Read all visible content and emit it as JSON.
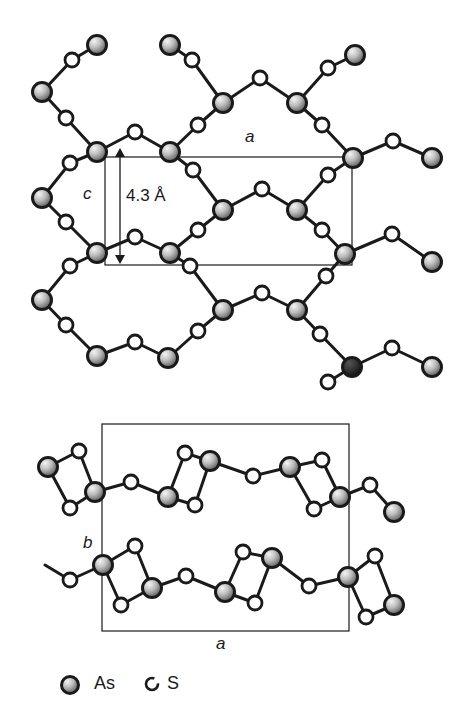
{
  "figure": {
    "top_view": {
      "axis_a_label": "a",
      "axis_c_label": "c",
      "spacing_label": "4.3 Å",
      "unit_cell": {
        "x1": 105,
        "y1": 157,
        "x2": 352,
        "y2": 265
      },
      "arrow": {
        "x": 120,
        "y1": 148,
        "y2": 264
      },
      "bonds": [
        [
          97,
          45,
          72,
          60
        ],
        [
          72,
          60,
          42,
          92
        ],
        [
          42,
          92,
          66,
          118
        ],
        [
          66,
          118,
          97,
          152
        ],
        [
          97,
          152,
          135,
          132
        ],
        [
          135,
          132,
          170,
          152
        ],
        [
          170,
          45,
          192,
          60
        ],
        [
          192,
          60,
          223,
          103
        ],
        [
          223,
          103,
          260,
          78
        ],
        [
          260,
          78,
          297,
          103
        ],
        [
          297,
          103,
          328,
          68
        ],
        [
          328,
          68,
          355,
          55
        ],
        [
          223,
          103,
          198,
          125
        ],
        [
          198,
          125,
          170,
          152
        ],
        [
          297,
          103,
          322,
          125
        ],
        [
          322,
          125,
          353,
          158
        ],
        [
          353,
          158,
          393,
          141
        ],
        [
          393,
          141,
          432,
          158
        ],
        [
          97,
          152,
          70,
          163
        ],
        [
          70,
          163,
          42,
          198
        ],
        [
          42,
          198,
          66,
          222
        ],
        [
          66,
          222,
          97,
          253
        ],
        [
          170,
          152,
          193,
          170
        ],
        [
          193,
          170,
          223,
          210
        ],
        [
          223,
          210,
          262,
          189
        ],
        [
          262,
          189,
          297,
          210
        ],
        [
          297,
          210,
          328,
          175
        ],
        [
          328,
          175,
          353,
          158
        ],
        [
          97,
          253,
          135,
          237
        ],
        [
          135,
          237,
          170,
          253
        ],
        [
          170,
          253,
          198,
          230
        ],
        [
          198,
          230,
          223,
          210
        ],
        [
          297,
          210,
          322,
          230
        ],
        [
          322,
          230,
          345,
          254
        ],
        [
          345,
          254,
          392,
          234
        ],
        [
          392,
          234,
          432,
          262
        ],
        [
          97,
          253,
          70,
          266
        ],
        [
          70,
          266,
          42,
          300
        ],
        [
          42,
          300,
          66,
          325
        ],
        [
          66,
          325,
          97,
          356
        ],
        [
          170,
          253,
          190,
          266
        ],
        [
          190,
          266,
          223,
          310
        ],
        [
          223,
          310,
          262,
          293
        ],
        [
          262,
          293,
          297,
          310
        ],
        [
          297,
          310,
          326,
          276
        ],
        [
          326,
          276,
          345,
          254
        ],
        [
          97,
          356,
          135,
          342
        ],
        [
          135,
          342,
          168,
          358
        ],
        [
          168,
          358,
          198,
          331
        ],
        [
          198,
          331,
          223,
          310
        ],
        [
          297,
          310,
          320,
          334
        ],
        [
          320,
          334,
          352,
          367
        ],
        [
          352,
          367,
          328,
          382
        ],
        [
          352,
          367,
          392,
          348
        ],
        [
          392,
          348,
          432,
          367
        ]
      ],
      "atoms": [
        {
          "el": "As",
          "x": 97,
          "y": 45
        },
        {
          "el": "As",
          "x": 170,
          "y": 45
        },
        {
          "el": "As",
          "x": 355,
          "y": 55
        },
        {
          "el": "S",
          "x": 72,
          "y": 60
        },
        {
          "el": "S",
          "x": 192,
          "y": 60
        },
        {
          "el": "S",
          "x": 328,
          "y": 68
        },
        {
          "el": "As",
          "x": 42,
          "y": 92
        },
        {
          "el": "S",
          "x": 260,
          "y": 78
        },
        {
          "el": "S",
          "x": 66,
          "y": 118
        },
        {
          "el": "As",
          "x": 223,
          "y": 103
        },
        {
          "el": "As",
          "x": 297,
          "y": 103
        },
        {
          "el": "S",
          "x": 198,
          "y": 125
        },
        {
          "el": "S",
          "x": 322,
          "y": 125
        },
        {
          "el": "S",
          "x": 135,
          "y": 132
        },
        {
          "el": "As",
          "x": 97,
          "y": 152
        },
        {
          "el": "As",
          "x": 170,
          "y": 152
        },
        {
          "el": "S",
          "x": 393,
          "y": 141
        },
        {
          "el": "As",
          "x": 432,
          "y": 158
        },
        {
          "el": "As",
          "x": 353,
          "y": 158
        },
        {
          "el": "S",
          "x": 70,
          "y": 163
        },
        {
          "el": "S",
          "x": 193,
          "y": 170
        },
        {
          "el": "S",
          "x": 328,
          "y": 175
        },
        {
          "el": "S",
          "x": 262,
          "y": 189
        },
        {
          "el": "As",
          "x": 42,
          "y": 198
        },
        {
          "el": "As",
          "x": 223,
          "y": 210
        },
        {
          "el": "As",
          "x": 297,
          "y": 210
        },
        {
          "el": "S",
          "x": 66,
          "y": 222
        },
        {
          "el": "S",
          "x": 198,
          "y": 230
        },
        {
          "el": "S",
          "x": 322,
          "y": 230
        },
        {
          "el": "S",
          "x": 135,
          "y": 237
        },
        {
          "el": "As",
          "x": 97,
          "y": 253
        },
        {
          "el": "As",
          "x": 170,
          "y": 253
        },
        {
          "el": "S",
          "x": 392,
          "y": 234
        },
        {
          "el": "As",
          "x": 432,
          "y": 262
        },
        {
          "el": "As",
          "x": 345,
          "y": 254
        },
        {
          "el": "S",
          "x": 70,
          "y": 266
        },
        {
          "el": "S",
          "x": 190,
          "y": 266
        },
        {
          "el": "S",
          "x": 326,
          "y": 276
        },
        {
          "el": "S",
          "x": 262,
          "y": 293
        },
        {
          "el": "As",
          "x": 42,
          "y": 300
        },
        {
          "el": "As",
          "x": 223,
          "y": 310
        },
        {
          "el": "As",
          "x": 297,
          "y": 310
        },
        {
          "el": "S",
          "x": 66,
          "y": 325
        },
        {
          "el": "S",
          "x": 198,
          "y": 331
        },
        {
          "el": "S",
          "x": 320,
          "y": 334
        },
        {
          "el": "S",
          "x": 135,
          "y": 342
        },
        {
          "el": "As",
          "x": 97,
          "y": 356
        },
        {
          "el": "As",
          "x": 168,
          "y": 358
        },
        {
          "el": "S",
          "x": 392,
          "y": 348
        },
        {
          "el": "As",
          "x": 432,
          "y": 367
        },
        {
          "el": "AsDark",
          "x": 352,
          "y": 367
        },
        {
          "el": "S",
          "x": 328,
          "y": 382
        }
      ]
    },
    "side_view": {
      "axis_a_label": "a",
      "axis_b_label": "b",
      "unit_cell": {
        "x1": 102,
        "y1": 424,
        "x2": 349,
        "y2": 631
      },
      "bonds": [
        [
          48,
          467,
          79,
          451
        ],
        [
          48,
          467,
          70,
          508
        ],
        [
          79,
          451,
          95,
          492
        ],
        [
          70,
          508,
          95,
          492
        ],
        [
          95,
          492,
          131,
          482
        ],
        [
          131,
          482,
          168,
          497
        ],
        [
          168,
          497,
          185,
          453
        ],
        [
          185,
          453,
          210,
          461
        ],
        [
          168,
          497,
          195,
          505
        ],
        [
          195,
          505,
          210,
          461
        ],
        [
          210,
          461,
          253,
          476
        ],
        [
          253,
          476,
          290,
          467
        ],
        [
          290,
          467,
          322,
          460
        ],
        [
          290,
          467,
          314,
          509
        ],
        [
          322,
          460,
          340,
          497
        ],
        [
          314,
          509,
          340,
          497
        ],
        [
          340,
          497,
          370,
          485
        ],
        [
          370,
          485,
          394,
          512
        ],
        [
          45,
          565,
          70,
          580
        ],
        [
          70,
          580,
          103,
          565
        ],
        [
          103,
          565,
          135,
          546
        ],
        [
          103,
          565,
          121,
          605
        ],
        [
          135,
          546,
          152,
          588
        ],
        [
          121,
          605,
          152,
          588
        ],
        [
          152,
          588,
          186,
          576
        ],
        [
          186,
          576,
          225,
          592
        ],
        [
          225,
          592,
          243,
          552
        ],
        [
          243,
          552,
          272,
          558
        ],
        [
          225,
          592,
          255,
          603
        ],
        [
          255,
          603,
          272,
          558
        ],
        [
          272,
          558,
          309,
          586
        ],
        [
          309,
          586,
          348,
          577
        ],
        [
          348,
          577,
          375,
          556
        ],
        [
          348,
          577,
          366,
          617
        ],
        [
          375,
          556,
          394,
          605
        ],
        [
          366,
          617,
          394,
          605
        ]
      ],
      "atoms": [
        {
          "el": "As",
          "x": 48,
          "y": 467
        },
        {
          "el": "S",
          "x": 79,
          "y": 451
        },
        {
          "el": "S",
          "x": 70,
          "y": 508
        },
        {
          "el": "As",
          "x": 95,
          "y": 492
        },
        {
          "el": "S",
          "x": 131,
          "y": 482
        },
        {
          "el": "As",
          "x": 168,
          "y": 497
        },
        {
          "el": "S",
          "x": 185,
          "y": 453
        },
        {
          "el": "As",
          "x": 210,
          "y": 461
        },
        {
          "el": "S",
          "x": 195,
          "y": 505
        },
        {
          "el": "S",
          "x": 253,
          "y": 476
        },
        {
          "el": "As",
          "x": 290,
          "y": 467
        },
        {
          "el": "S",
          "x": 322,
          "y": 460
        },
        {
          "el": "As",
          "x": 340,
          "y": 497
        },
        {
          "el": "S",
          "x": 314,
          "y": 509
        },
        {
          "el": "S",
          "x": 370,
          "y": 485
        },
        {
          "el": "As",
          "x": 394,
          "y": 512
        },
        {
          "el": "S",
          "x": 70,
          "y": 580
        },
        {
          "el": "As",
          "x": 103,
          "y": 565
        },
        {
          "el": "S",
          "x": 135,
          "y": 546
        },
        {
          "el": "S",
          "x": 121,
          "y": 605
        },
        {
          "el": "As",
          "x": 152,
          "y": 588
        },
        {
          "el": "S",
          "x": 186,
          "y": 576
        },
        {
          "el": "As",
          "x": 225,
          "y": 592
        },
        {
          "el": "S",
          "x": 243,
          "y": 552
        },
        {
          "el": "As",
          "x": 272,
          "y": 558
        },
        {
          "el": "S",
          "x": 255,
          "y": 603
        },
        {
          "el": "S",
          "x": 309,
          "y": 586
        },
        {
          "el": "As",
          "x": 348,
          "y": 577
        },
        {
          "el": "S",
          "x": 375,
          "y": 556
        },
        {
          "el": "S",
          "x": 366,
          "y": 617
        },
        {
          "el": "As",
          "x": 394,
          "y": 605
        }
      ]
    },
    "legend": {
      "items": [
        {
          "symbol": "As",
          "label": "As"
        },
        {
          "symbol": "S",
          "label": "S"
        }
      ]
    },
    "colors": {
      "ink": "#1a1a1a",
      "as_fill_light": "#e8e8e8",
      "as_fill_dark": "#6a6a6a",
      "s_fill": "#ffffff",
      "background": "#ffffff"
    }
  }
}
